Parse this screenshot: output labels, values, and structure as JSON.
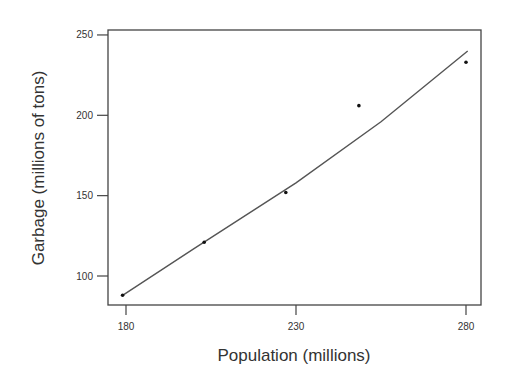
{
  "chart_data": {
    "type": "scatter",
    "title": "",
    "xlabel": "Population (millions)",
    "ylabel": "Garbage (millions of tons)",
    "xlim": [
      178,
      284
    ],
    "ylim": [
      82,
      259
    ],
    "x_ticks": [
      180,
      230,
      280
    ],
    "y_ticks": [
      100,
      150,
      200,
      250
    ],
    "grid": false,
    "legend": null,
    "series": [
      {
        "name": "observed",
        "kind": "points",
        "x": [
          179,
          203,
          227,
          248.5,
          280
        ],
        "y": [
          88,
          121,
          152,
          206,
          233
        ]
      },
      {
        "name": "fitted curve",
        "kind": "line",
        "x": [
          179,
          200,
          230,
          255,
          280.5
        ],
        "y": [
          88,
          117,
          158,
          196,
          240
        ]
      }
    ]
  },
  "axes": {
    "x_title": "Population (millions)",
    "y_title": "Garbage (millions of tons)",
    "x_tick_labels": [
      "180",
      "230",
      "280"
    ],
    "y_tick_labels": [
      "100",
      "150",
      "200",
      "250"
    ]
  }
}
